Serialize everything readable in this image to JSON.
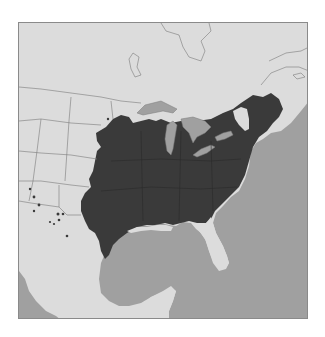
{
  "map": {
    "type": "species-range-map",
    "region": "Eastern North America",
    "legend": [],
    "colors": {
      "land": "#dcdcdc",
      "water": "#a0a0a0",
      "range": "#3a3a3a",
      "borders": "#7a7a7a",
      "frame": "#8a8a8a"
    },
    "outlier_points": [
      [
        29,
        188
      ],
      [
        33,
        196
      ],
      [
        38,
        204
      ],
      [
        33,
        210
      ],
      [
        57,
        213
      ],
      [
        62,
        213
      ],
      [
        49,
        221
      ],
      [
        53,
        223
      ],
      [
        58,
        219
      ],
      [
        66,
        235
      ],
      [
        107,
        118
      ],
      [
        103,
        145
      ],
      [
        124,
        80
      ]
    ]
  }
}
